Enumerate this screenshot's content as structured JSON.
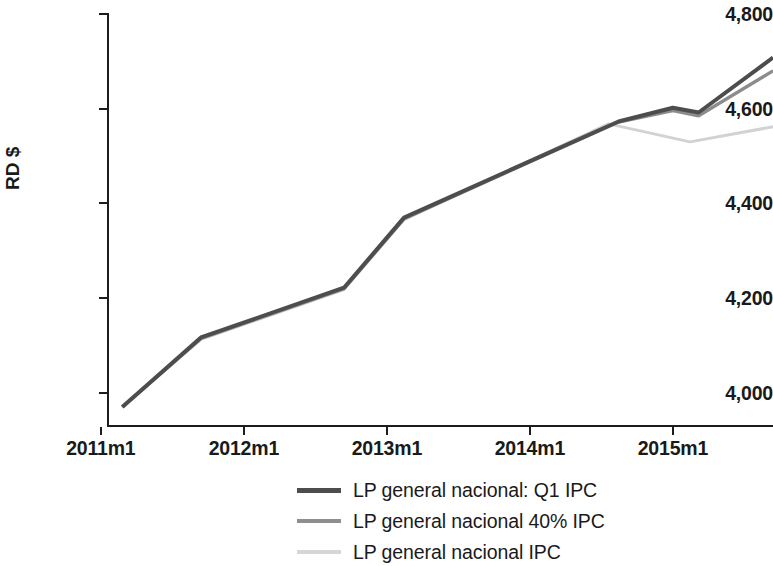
{
  "chart_data": {
    "type": "line",
    "title": "",
    "xlabel": "",
    "ylabel": "RD $",
    "ylim": [
      3930,
      4800
    ],
    "yticks": [
      4000,
      4200,
      4400,
      4600,
      4800
    ],
    "ytick_labels": [
      "4,000",
      "4,200",
      "4,400",
      "4,600",
      "4,800"
    ],
    "xlim": [
      2011.05,
      2015.7
    ],
    "xticks": [
      2011,
      2012,
      2013,
      2014,
      2015
    ],
    "xtick_labels": [
      "2011m1",
      "2012m1",
      "2013m1",
      "2014m1",
      "2015m1"
    ],
    "grid": false,
    "legend_position": "bottom-center",
    "series": [
      {
        "name": "LP general nacional: Q1 IPC",
        "color": "#4d4d4d",
        "width": 4.0,
        "x": [
          2011.15,
          2011.7,
          2012.7,
          2013.12,
          2014.62,
          2015.0,
          2015.18,
          2015.7
        ],
        "values": [
          3970,
          4117,
          4222,
          4370,
          4573,
          4602,
          4592,
          4708
        ]
      },
      {
        "name": "LP general nacional 40% IPC",
        "color": "#8c8c8c",
        "width": 3.4,
        "x": [
          2011.15,
          2011.7,
          2012.7,
          2013.12,
          2014.62,
          2015.0,
          2015.18,
          2015.7
        ],
        "values": [
          3970,
          4115,
          4220,
          4368,
          4572,
          4596,
          4585,
          4680
        ]
      },
      {
        "name": "LP general nacional IPC",
        "color": "#d2d2d2",
        "width": 3.0,
        "x": [
          2011.15,
          2011.7,
          2012.7,
          2013.12,
          2014.55,
          2015.12,
          2015.7
        ],
        "values": [
          3970,
          4113,
          4218,
          4366,
          4568,
          4530,
          4562
        ]
      }
    ]
  },
  "axis": {
    "y_title": "RD $"
  },
  "legend": {
    "items": [
      {
        "label": "LP general nacional: Q1 IPC",
        "color": "#4d4d4d",
        "thickness": "5px"
      },
      {
        "label": "LP general nacional 40% IPC",
        "color": "#8e8e8e",
        "thickness": "4px"
      },
      {
        "label": "LP general nacional IPC",
        "color": "#d6d6d6",
        "thickness": "4px"
      }
    ]
  }
}
